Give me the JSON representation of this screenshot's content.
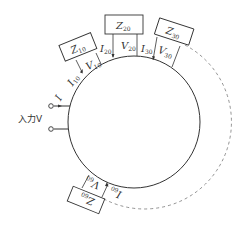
{
  "diagram": {
    "type": "ring-network",
    "input_label": "入力V",
    "input_current_label": "I",
    "ring": {
      "cx": 134,
      "cy": 122,
      "r": 66,
      "stroke": "#333333"
    },
    "dashed_arc_color": "#777777",
    "elements": [
      {
        "id": "z10",
        "impedance": "Z",
        "impedance_sub": "10",
        "voltage": "V",
        "voltage_sub": "10",
        "current": "I",
        "current_sub": "10"
      },
      {
        "id": "z20",
        "impedance": "Z",
        "impedance_sub": "20",
        "voltage": "V",
        "voltage_sub": "20",
        "current": "I",
        "current_sub": "20"
      },
      {
        "id": "z30",
        "impedance": "Z",
        "impedance_sub": "30",
        "voltage": "V",
        "voltage_sub": "30",
        "current": "I",
        "current_sub": "30"
      },
      {
        "id": "z60",
        "impedance": "Z",
        "impedance_sub": "60",
        "voltage": "V",
        "voltage_sub": "60",
        "current": "I",
        "current_sub": "60"
      }
    ]
  }
}
